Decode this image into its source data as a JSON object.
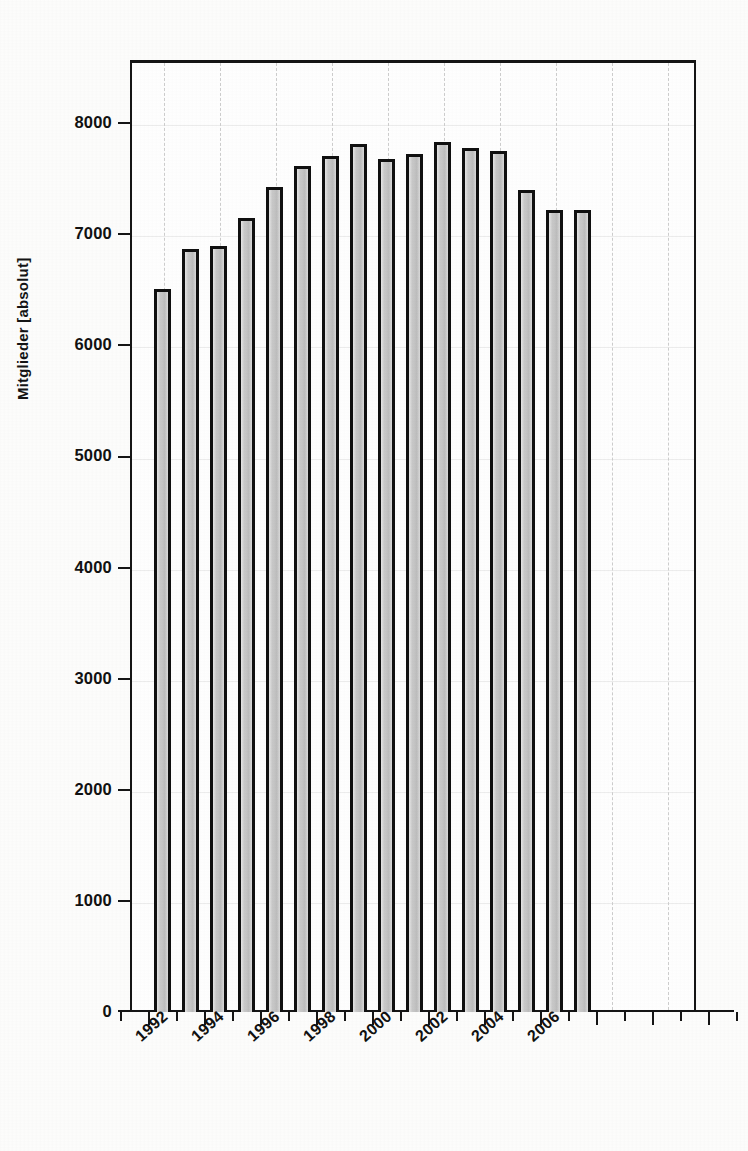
{
  "chart_data": {
    "type": "bar",
    "title": "",
    "subtitle": "",
    "xlabel": "",
    "ylabel": "Mitglieder [absolut]",
    "categories": [
      "1992",
      "1993",
      "1994",
      "1995",
      "1996",
      "1997",
      "1998",
      "1999",
      "2000",
      "2001",
      "2002",
      "2003",
      "2004",
      "2005",
      "2006",
      "2007"
    ],
    "values": [
      6500,
      6860,
      6890,
      7140,
      7420,
      7610,
      7700,
      7810,
      7670,
      7720,
      7820,
      7770,
      7740,
      7390,
      7210,
      7215
    ],
    "x_tick_labels": [
      "1992",
      "1994",
      "1996",
      "1998",
      "2000",
      "2002",
      "2004",
      "2006"
    ],
    "y_tick_labels": [
      "0",
      "1000",
      "2000",
      "3000",
      "4000",
      "5000",
      "6000",
      "7000",
      "8000"
    ],
    "y_ticks": [
      0,
      1000,
      2000,
      3000,
      4000,
      5000,
      6000,
      7000,
      8000
    ],
    "ylim": [
      0,
      8500
    ],
    "xlim": [
      1991.2,
      2010.5
    ],
    "grid": true,
    "grid_style": "dashed vertical, faint horizontal",
    "legend": null,
    "legend_position": "none",
    "bar_fill_color": "#c8c8c8",
    "bar_edge_color": "#101010",
    "axis_color": "#151515",
    "background_color": "#ffffff"
  },
  "axis": {
    "y_title": "Mitglieder [absolut]"
  }
}
